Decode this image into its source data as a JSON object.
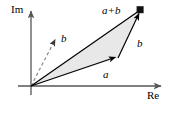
{
  "figure": {
    "title": "",
    "type": "vector-addition-complex-plane",
    "background_color": "#ffffff",
    "stroke_color": "#000000",
    "fill_color": "#e8e8e8",
    "dashed_color": "#888888"
  },
  "axes": {
    "imaginary": {
      "label": "Im",
      "icon": "arrow-up-icon",
      "origin": {
        "x": 31,
        "y": 86
      },
      "tip": {
        "x": 31,
        "y": 8
      }
    },
    "real": {
      "label": "Re",
      "icon": "arrow-right-icon",
      "origin": {
        "x": 31,
        "y": 86
      },
      "tip": {
        "x": 164,
        "y": 86
      }
    }
  },
  "vectors": [
    {
      "name": "vector-a",
      "label": "a",
      "style": "solid",
      "from": {
        "x": 31,
        "y": 86
      },
      "to": {
        "x": 118,
        "y": 58
      },
      "arrowhead": "filled-triangle"
    },
    {
      "name": "vector-b-translated",
      "label": "b",
      "style": "solid",
      "from": {
        "x": 118,
        "y": 58
      },
      "to": {
        "x": 140,
        "y": 10
      },
      "arrowhead": "filled-triangle"
    },
    {
      "name": "vector-a-plus-b",
      "label": "a+b",
      "style": "solid",
      "from": {
        "x": 31,
        "y": 86
      },
      "to": {
        "x": 140,
        "y": 10
      },
      "arrowhead": "filled-square"
    },
    {
      "name": "vector-b-at-origin",
      "label": "b",
      "style": "dashed",
      "from": {
        "x": 31,
        "y": 86
      },
      "to": {
        "x": 56,
        "y": 37
      },
      "arrowhead": "filled-triangle"
    }
  ],
  "shaded_region": {
    "name": "triangle-fill",
    "points": "31,86 118,58 140,10",
    "fill": "#e8e8e8"
  },
  "labels": {
    "im": "Im",
    "re": "Re",
    "a": "a",
    "b_dashed": "b",
    "b_translated": "b",
    "a_plus_b": "a+b"
  }
}
